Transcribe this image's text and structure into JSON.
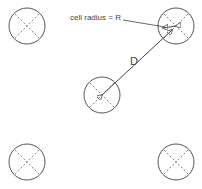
{
  "diagram": {
    "labels": {
      "radius_label": "cell radius = R",
      "distance_label": "D"
    },
    "cells": [
      {
        "id": "top-left",
        "cx": 27,
        "cy": 26,
        "r": 18
      },
      {
        "id": "top-right",
        "cx": 176,
        "cy": 26,
        "r": 18
      },
      {
        "id": "center",
        "cx": 102,
        "cy": 95,
        "r": 18
      },
      {
        "id": "bottom-left",
        "cx": 27,
        "cy": 162,
        "r": 18
      },
      {
        "id": "bottom-right",
        "cx": 176,
        "cy": 162,
        "r": 18
      }
    ],
    "colors": {
      "stroke": "#555555",
      "text": "#444444"
    }
  }
}
